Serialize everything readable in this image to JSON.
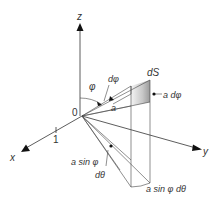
{
  "diagram": {
    "axes": {
      "z_label": "z",
      "x_label": "x",
      "y_label": "y",
      "origin_label": "0",
      "x_tick_label": "1"
    },
    "labels": {
      "phi": "φ",
      "d_phi": "dφ",
      "radius": "a",
      "dS": "dS",
      "a_d_phi": "a dφ",
      "a_sin_phi": "a sin φ",
      "d_theta": "dθ",
      "a_sin_phi_d_theta": "a sin φ dθ"
    },
    "colors": {
      "line": "#444444",
      "shade_dark": "#9a9a9a",
      "shade_light": "#f2f2f2"
    }
  }
}
